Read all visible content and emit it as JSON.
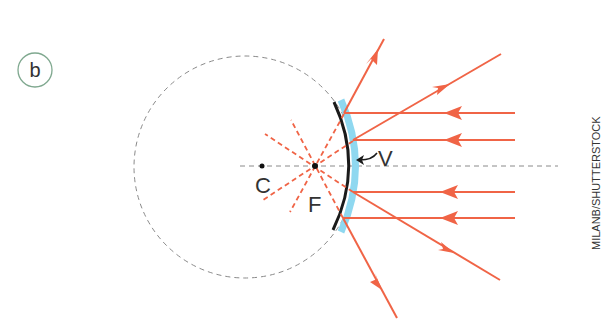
{
  "panel_label": "b",
  "labels": {
    "center": "C",
    "focus": "F",
    "vertex": "V"
  },
  "credit": "MILANB/SHUTTERSTOCK",
  "colors": {
    "ray": "#f06446",
    "mirror": "#1a1a1a",
    "mirror_backing": "#8fd8f0",
    "guide": "#8a8a8a",
    "panel_circle": "#7fa88f",
    "text": "#333333"
  },
  "geometry": {
    "axis_y": 166,
    "center_point": [
      262,
      166
    ],
    "focal_point": [
      315,
      166
    ],
    "vertex_point": [
      354,
      166
    ],
    "incident_rays_y": [
      113,
      140,
      192,
      218
    ]
  }
}
